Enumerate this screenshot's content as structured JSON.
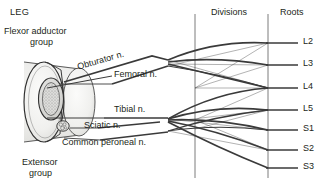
{
  "figure": {
    "title": "LEG",
    "muscle_groups": [
      {
        "name": "flexor-adductor-group",
        "line1": "Flexor adductor",
        "line2": "group"
      },
      {
        "name": "extensor-group",
        "line1": "Extensor",
        "line2": "group"
      }
    ],
    "column_headers": [
      {
        "name": "divisions",
        "label": "Divisions"
      },
      {
        "name": "roots",
        "label": "Roots"
      }
    ],
    "nerves": [
      {
        "name": "obturator",
        "label": "Obturator n."
      },
      {
        "name": "femoral",
        "label": "Femoral n."
      },
      {
        "name": "tibial",
        "label": "Tibial n."
      },
      {
        "name": "sciatic",
        "label": "Sciatic n."
      },
      {
        "name": "common-peroneal",
        "label": "Common peroneal n."
      }
    ],
    "roots": [
      {
        "name": "L2",
        "label": "L2"
      },
      {
        "name": "L3",
        "label": "L3"
      },
      {
        "name": "L4",
        "label": "L4"
      },
      {
        "name": "L5",
        "label": "L5"
      },
      {
        "name": "S1",
        "label": "S1"
      },
      {
        "name": "S2",
        "label": "S2"
      },
      {
        "name": "S3",
        "label": "S3"
      }
    ],
    "anatomy_parts": [
      {
        "name": "limb-cross-section",
        "label": "limb cross section"
      },
      {
        "name": "femur-bone",
        "label": "femur"
      },
      {
        "name": "sciatic-nerve-bundle",
        "label": "sciatic nerve bundle"
      }
    ],
    "colors": {
      "ink": "#231f20",
      "line": "#404040",
      "thin_line": "#8a8a8a",
      "limb_fill": "#f2f2f0",
      "limb_shade": "#dcdcda",
      "bone_fill": "#dedede",
      "background": "#ffffff"
    }
  }
}
